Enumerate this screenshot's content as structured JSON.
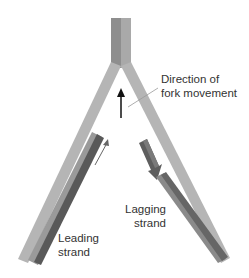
{
  "diagram": {
    "labels": {
      "direction_line1": "Direction of",
      "direction_line2": "fork movement",
      "leading_line1": "Leading",
      "leading_line2": "strand",
      "lagging_line1": "Lagging",
      "lagging_line2": "strand"
    },
    "colors": {
      "parental_strand": "#9a9a9a",
      "parental_strand_light": "#b0b0b0",
      "new_strand": "#6a6a6a",
      "new_strand_dark": "#4e4e4e",
      "arrow": "#222222",
      "leader_line": "#999999"
    }
  }
}
